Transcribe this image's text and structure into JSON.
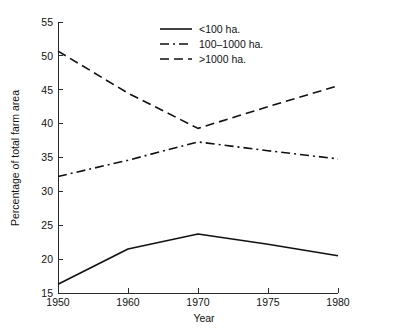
{
  "chart_data": {
    "type": "line",
    "title": "",
    "xlabel": "Year",
    "ylabel": "Percentage of total farm area",
    "categories": [
      "1950",
      "1960",
      "1970",
      "1975",
      "1980"
    ],
    "x_tick_labels": [
      "1950",
      "1960",
      "1970",
      "1975",
      "1980"
    ],
    "y_tick_labels": [
      "15",
      "20",
      "25",
      "30",
      "35",
      "40",
      "45",
      "50",
      "55"
    ],
    "y_ticks": [
      15,
      20,
      25,
      30,
      35,
      40,
      45,
      50,
      55
    ],
    "ylim": [
      15,
      55
    ],
    "grid": false,
    "legend_position": "upper-center",
    "line_color": "#111111",
    "background_color": "#ffffff",
    "series": [
      {
        "name": "<100 ha.",
        "style": "solid",
        "values": [
          16.3,
          21.5,
          23.7,
          22.2,
          20.5
        ]
      },
      {
        "name": "100–1000 ha.",
        "style": "dash-dot",
        "values": [
          32.2,
          34.6,
          37.3,
          36.0,
          34.8
        ]
      },
      {
        "name": ">1000 ha.",
        "style": "dashed",
        "values": [
          50.7,
          44.5,
          39.3,
          42.5,
          45.6
        ]
      }
    ]
  },
  "axes": {
    "y_label": "Percentage of total farm area",
    "x_label": "Year"
  },
  "legend": {
    "entries": [
      {
        "label": "<100 ha."
      },
      {
        "label": "100–1000 ha."
      },
      {
        "label": ">1000 ha."
      }
    ]
  },
  "y_tick_text": {
    "t0": "15",
    "t1": "20",
    "t2": "25",
    "t3": "30",
    "t4": "35",
    "t5": "40",
    "t6": "45",
    "t7": "50",
    "t8": "55"
  },
  "x_tick_text": {
    "t0": "1950",
    "t1": "1960",
    "t2": "1970",
    "t3": "1975",
    "t4": "1980"
  }
}
